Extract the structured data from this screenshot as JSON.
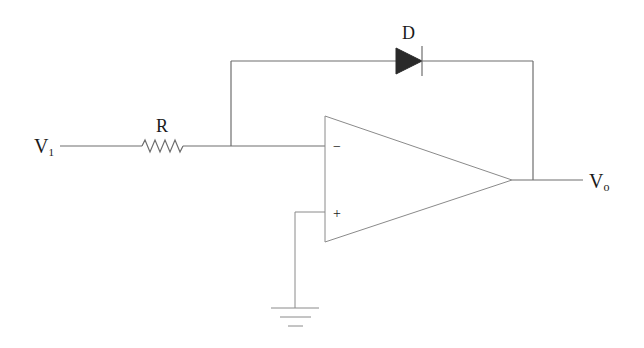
{
  "diagram": {
    "type": "circuit-schematic",
    "labels": {
      "input": {
        "main": "V",
        "sub": "1"
      },
      "output": {
        "main": "V",
        "sub": "o"
      },
      "resistor": "R",
      "diode": "D",
      "inverting_input": "−",
      "noninverting_input": "+"
    },
    "components": [
      {
        "id": "R",
        "kind": "resistor",
        "label": "R"
      },
      {
        "id": "D",
        "kind": "diode",
        "label": "D",
        "orientation": "anode-left, cathode-right"
      },
      {
        "id": "U1",
        "kind": "op-amp",
        "inputs": [
          "−",
          "+"
        ]
      },
      {
        "id": "GND",
        "kind": "ground"
      }
    ],
    "colors": {
      "wire": "#6e6e6e",
      "diode_fill": "#2a2a2a",
      "text": "#1a1a1a"
    }
  }
}
